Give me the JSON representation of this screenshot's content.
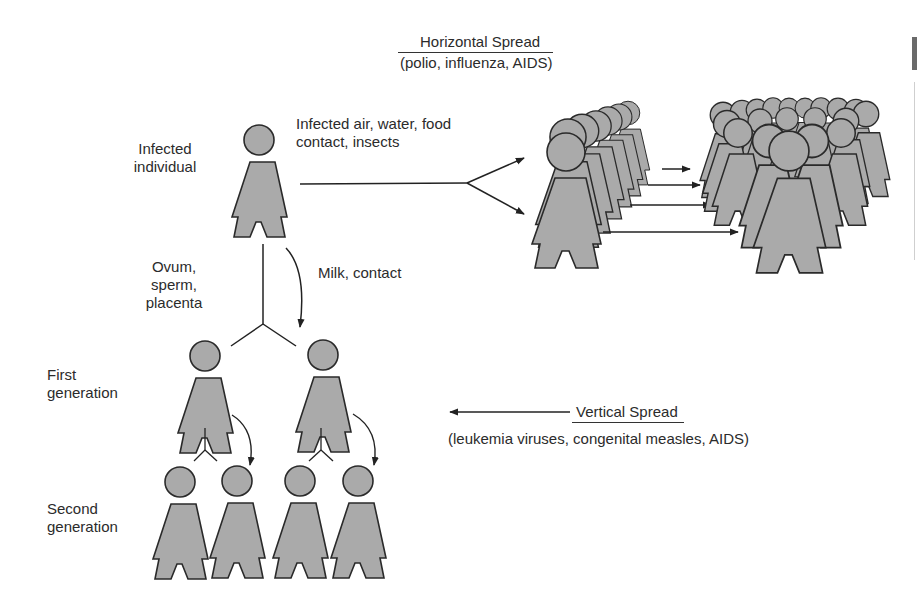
{
  "horizontal": {
    "title": "Horizontal Spread",
    "examples": "(polio, influenza, AIDS)",
    "route_label_line1": "Infected air, water, food",
    "route_label_line2": "contact, insects"
  },
  "vertical": {
    "title": "Vertical Spread",
    "examples": "(leukemia viruses, congenital measles, AIDS)"
  },
  "labels": {
    "infected_line1": "Infected",
    "infected_line2": "individual",
    "germline_line1": "Ovum,",
    "germline_line2": "sperm,",
    "germline_line3": "placenta",
    "milk_contact": "Milk, contact",
    "first_gen_line1": "First",
    "first_gen_line2": "generation",
    "second_gen_line1": "Second",
    "second_gen_line2": "generation"
  },
  "colors": {
    "figure_fill": "#aaaaaa",
    "figure_stroke": "#2a2a2a",
    "text": "#2b2b2b",
    "edge_tab": "#6a6a6a"
  }
}
